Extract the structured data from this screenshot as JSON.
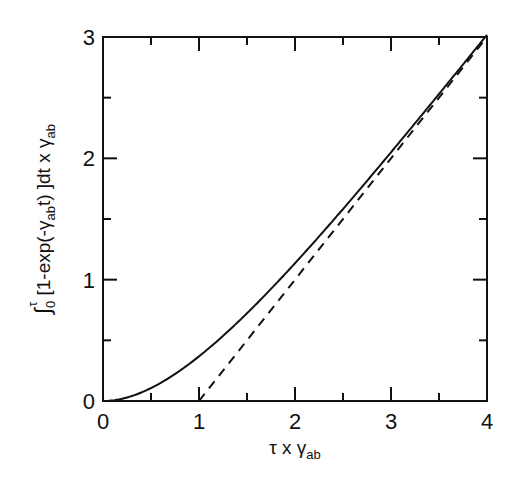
{
  "chart_data": {
    "type": "line",
    "title": "",
    "xlabel": "τ x γab",
    "xlabel_parts": {
      "main": "τ x γ",
      "sub": "ab"
    },
    "ylabel": "∫0τ [1-exp(-γab t) ]dt x γab",
    "ylabel_parts": {
      "integral": "∫",
      "lower": "0",
      "upper": "τ",
      "body1": "[1-exp(-γ",
      "body_sub": "ab",
      "body2": "t) ]dt  x γ",
      "end_sub": "ab"
    },
    "xlim": [
      0,
      4
    ],
    "ylim": [
      0,
      3
    ],
    "x_ticks": [
      "0",
      "1",
      "2",
      "3",
      "4"
    ],
    "y_ticks": [
      "0",
      "1",
      "2",
      "3"
    ],
    "x_minor_ticks": [
      0.5,
      1.5,
      2.5,
      3.5
    ],
    "y_minor_ticks": [
      0.5,
      1.5,
      2.5
    ],
    "grid": false,
    "legend": null,
    "series": [
      {
        "name": "integral (solid)",
        "style": "solid",
        "formula": "τ - 1 + exp(-τ)",
        "x": [
          0,
          0.25,
          0.5,
          0.75,
          1.0,
          1.25,
          1.5,
          1.75,
          2.0,
          2.25,
          2.5,
          2.75,
          3.0,
          3.25,
          3.5,
          3.75,
          4.0
        ],
        "y": [
          0,
          0.03,
          0.11,
          0.22,
          0.37,
          0.54,
          0.72,
          0.92,
          1.14,
          1.36,
          1.58,
          1.81,
          2.05,
          2.29,
          2.53,
          2.77,
          3.0
        ]
      },
      {
        "name": "asymptote (dashed)",
        "style": "dashed",
        "formula": "τ - 1",
        "x": [
          1,
          4
        ],
        "y": [
          0,
          3
        ]
      }
    ]
  },
  "colors": {
    "line": "#111111",
    "frame": "#111111",
    "background": "#ffffff"
  }
}
